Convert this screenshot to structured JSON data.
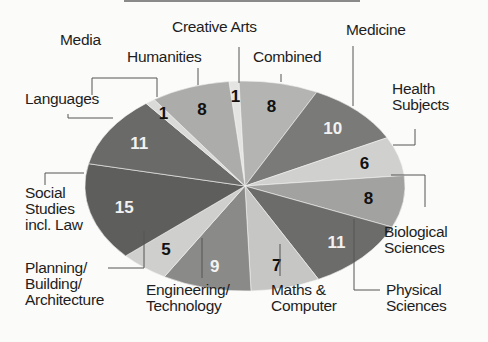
{
  "chart_data": {
    "type": "pie",
    "title": "",
    "start_offset_pct": -1.6,
    "slices": [
      {
        "label": "Creative Arts",
        "value": 1,
        "color": "#e4e4e2",
        "text_color": "#111111"
      },
      {
        "label": "Combined",
        "value": 8,
        "color": "#b4b4b2",
        "text_color": "#111111"
      },
      {
        "label": "Medicine",
        "value": 10,
        "color": "#7a7a78",
        "text_color": "#f2f2f2"
      },
      {
        "label": "Health Subjects",
        "value": 6,
        "color": "#d0d0ce",
        "text_color": "#111111"
      },
      {
        "label": "Biological Sciences",
        "value": 8,
        "color": "#a2a2a0",
        "text_color": "#111111"
      },
      {
        "label": "Physical Sciences",
        "value": 11,
        "color": "#6c6c6a",
        "text_color": "#f2f2f2"
      },
      {
        "label": "Maths & Computer",
        "value": 7,
        "color": "#c6c6c4",
        "text_color": "#111111"
      },
      {
        "label": "Engineering/ Technology",
        "value": 9,
        "color": "#8a8a88",
        "text_color": "#f2f2f2"
      },
      {
        "label": "Planning/ Building/ Architecture",
        "value": 5,
        "color": "#cfcfcd",
        "text_color": "#111111"
      },
      {
        "label": "Social Studies incl. Law",
        "value": 15,
        "color": "#5e5e5c",
        "text_color": "#f2f2f2"
      },
      {
        "label": "Languages",
        "value": 11,
        "color": "#6a6a68",
        "text_color": "#f2f2f2"
      },
      {
        "label": "Media",
        "value": 1,
        "color": "#dadad8",
        "text_color": "#111111"
      },
      {
        "label": "Humanities",
        "value": 8,
        "color": "#acacaa",
        "text_color": "#111111"
      }
    ]
  },
  "labels": {
    "creative_arts": "Creative Arts",
    "media": "Media",
    "humanities": "Humanities",
    "combined": "Combined",
    "medicine": "Medicine",
    "health": "Health\nSubjects",
    "languages": "Languages",
    "social": "Social\nStudies\nincl. Law",
    "biological": "Biological\nSciences",
    "planning": "Planning/\nBuilding/\nArchitecture",
    "engineering": "Engineering/\nTechnology",
    "maths": "Maths &\nComputer",
    "physical": "Physical\nSciences"
  }
}
